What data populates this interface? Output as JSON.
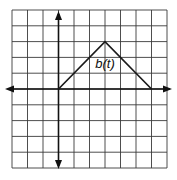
{
  "chart_data": {
    "type": "line",
    "title": "",
    "xlabel": "",
    "ylabel": "",
    "grid": true,
    "grid_cells": {
      "columns": 10,
      "rows": 10
    },
    "xlim": [
      -3,
      7
    ],
    "ylim": [
      -5,
      5
    ],
    "series": [
      {
        "name": "b(t)",
        "points": [
          [
            0,
            0
          ],
          [
            3,
            3
          ],
          [
            6,
            0
          ]
        ]
      }
    ],
    "annotations": [
      {
        "text": "b(t)",
        "x": 3,
        "y": 1.5
      }
    ],
    "axes": {
      "x_arrows": true,
      "y_arrows": true,
      "tick_labels": false
    }
  },
  "label": {
    "text": "b(t)"
  }
}
